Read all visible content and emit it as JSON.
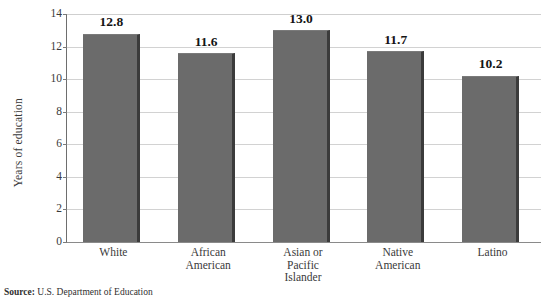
{
  "chart_data": {
    "type": "bar",
    "title": "",
    "xlabel": "",
    "ylabel": "Years of education",
    "categories": [
      "White",
      "African American",
      "Asian or Pacific Islander",
      "Native American",
      "Latino"
    ],
    "category_lines": [
      [
        "White"
      ],
      [
        "African",
        "American"
      ],
      [
        "Asian or",
        "Pacific",
        "Islander"
      ],
      [
        "Native",
        "American"
      ],
      [
        "Latino"
      ]
    ],
    "values": [
      12.8,
      11.6,
      13.0,
      11.7,
      10.2
    ],
    "value_labels": [
      "12.8",
      "11.6",
      "13.0",
      "11.7",
      "10.2"
    ],
    "ylim": [
      0,
      14
    ],
    "yticks": [
      0,
      2,
      4,
      6,
      8,
      10,
      12,
      14
    ],
    "ytick_labels": [
      "0",
      "2",
      "4",
      "6",
      "8",
      "10",
      "12",
      "14"
    ],
    "grid": true,
    "grid_axis": "y",
    "legend": false,
    "bar_color": "#6b6b6b",
    "bar_edge_color": "#3b3b3b",
    "gridline_color": "#d2d2d2",
    "axis_color": "#6e6e6e",
    "background_color": "#ffffff"
  },
  "source": {
    "label": "Source:",
    "text": "U.S. Department of Education"
  }
}
